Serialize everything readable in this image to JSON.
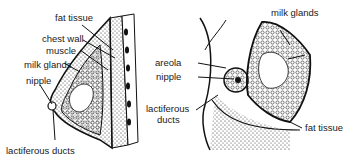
{
  "left_diagram": {
    "view": "side cross-section",
    "labels": {
      "fat_tissue": "fat tissue",
      "chest_wall": "chest wall",
      "muscle": "muscle",
      "milk_glands": "milk glands",
      "nipple": "nipple",
      "lactiferous_ducts": "lactiferous ducts"
    }
  },
  "right_diagram": {
    "view": "front cutaway",
    "labels": {
      "milk_glands": "milk glands",
      "areola": "areola",
      "nipple": "nipple",
      "lactiferous_ducts_line1": "lactiferous",
      "lactiferous_ducts_line2": "ducts",
      "fat_tissue": "fat tissue"
    }
  },
  "colors": {
    "ink": "#1a1a1a",
    "background": "#ffffff"
  }
}
